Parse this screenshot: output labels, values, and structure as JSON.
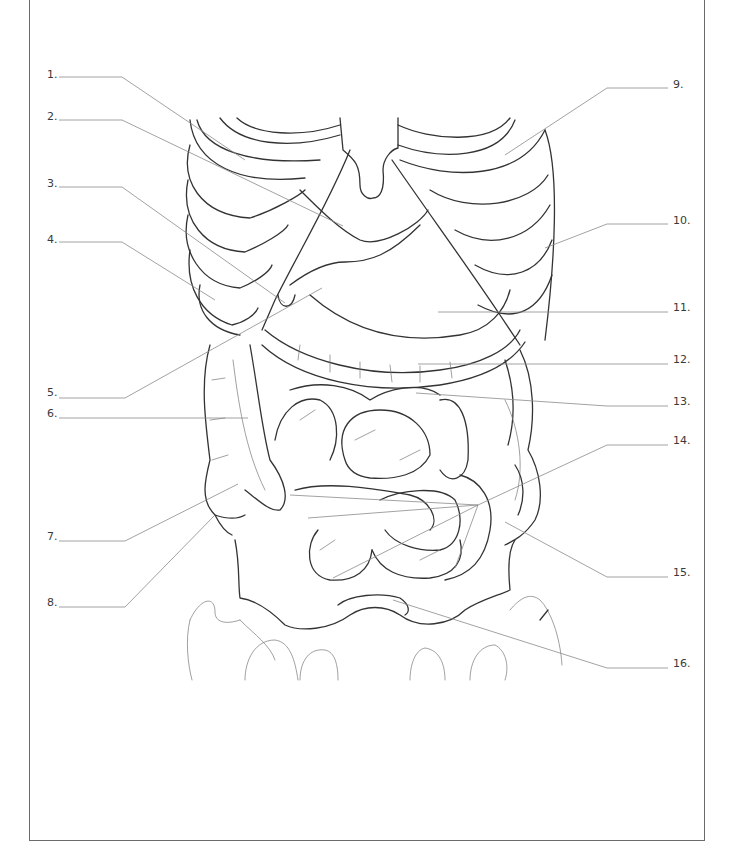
{
  "diagram": {
    "title": "",
    "border_color": "#6b6b6b",
    "line_color": "#333333",
    "leader_color": "#8a8a8a"
  },
  "labels": [
    {
      "id": 1,
      "text": "1.",
      "side": "left",
      "x": 47,
      "y": 69,
      "line": [
        [
          59,
          77
        ],
        [
          122,
          77
        ],
        [
          245,
          160
        ]
      ]
    },
    {
      "id": 2,
      "text": "2.",
      "side": "left",
      "x": 47,
      "y": 111,
      "line": [
        [
          59,
          120
        ],
        [
          122,
          120
        ],
        [
          343,
          226
        ]
      ]
    },
    {
      "id": 3,
      "text": "3.",
      "side": "left",
      "x": 47,
      "y": 178,
      "line": [
        [
          59,
          187
        ],
        [
          122,
          187
        ],
        [
          285,
          303
        ]
      ]
    },
    {
      "id": 4,
      "text": "4.",
      "side": "left",
      "x": 47,
      "y": 234,
      "line": [
        [
          59,
          242
        ],
        [
          122,
          242
        ],
        [
          215,
          300
        ]
      ]
    },
    {
      "id": 5,
      "text": "5.",
      "side": "left",
      "x": 47,
      "y": 387,
      "line": [
        [
          59,
          398
        ],
        [
          125,
          398
        ],
        [
          322,
          288
        ]
      ]
    },
    {
      "id": 6,
      "text": "6.",
      "side": "left",
      "x": 47,
      "y": 408,
      "line": [
        [
          59,
          418
        ],
        [
          248,
          418
        ]
      ]
    },
    {
      "id": 7,
      "text": "7.",
      "side": "left",
      "x": 47,
      "y": 531,
      "line": [
        [
          59,
          541
        ],
        [
          125,
          541
        ],
        [
          238,
          484
        ]
      ]
    },
    {
      "id": 8,
      "text": "8.",
      "side": "left",
      "x": 47,
      "y": 597,
      "line": [
        [
          59,
          607
        ],
        [
          125,
          607
        ],
        [
          215,
          515
        ]
      ]
    },
    {
      "id": 9,
      "text": "9.",
      "side": "right",
      "x": 673,
      "y": 79,
      "line": [
        [
          668,
          88
        ],
        [
          607,
          88
        ],
        [
          505,
          155
        ]
      ]
    },
    {
      "id": 10,
      "text": "10.",
      "side": "right",
      "x": 673,
      "y": 215,
      "line": [
        [
          668,
          224
        ],
        [
          607,
          224
        ],
        [
          545,
          248
        ]
      ]
    },
    {
      "id": 11,
      "text": "11.",
      "side": "right",
      "x": 673,
      "y": 302,
      "line": [
        [
          668,
          312
        ],
        [
          438,
          312
        ]
      ]
    },
    {
      "id": 12,
      "text": "12.",
      "side": "right",
      "x": 673,
      "y": 354,
      "line": [
        [
          668,
          364
        ],
        [
          418,
          364
        ]
      ]
    },
    {
      "id": 13,
      "text": "13.",
      "side": "right",
      "x": 673,
      "y": 396,
      "line": [
        [
          668,
          406
        ],
        [
          607,
          406
        ],
        [
          416,
          393
        ]
      ]
    },
    {
      "id": 14,
      "text": "14.",
      "side": "right",
      "x": 673,
      "y": 435,
      "line": [
        [
          668,
          445
        ],
        [
          607,
          445
        ],
        [
          478,
          505
        ]
      ]
    },
    {
      "id": 15,
      "text": "15.",
      "side": "right",
      "x": 673,
      "y": 567,
      "line": [
        [
          668,
          577
        ],
        [
          607,
          577
        ],
        [
          505,
          522
        ]
      ]
    },
    {
      "id": 16,
      "text": "16.",
      "side": "right",
      "x": 673,
      "y": 658,
      "line": [
        [
          668,
          668
        ],
        [
          607,
          668
        ],
        [
          393,
          600
        ]
      ]
    }
  ],
  "pointer_fans": [
    {
      "label": 14,
      "from": [
        478,
        505
      ],
      "to": [
        [
          290,
          495
        ],
        [
          308,
          518
        ],
        [
          333,
          578
        ],
        [
          455,
          568
        ]
      ]
    }
  ]
}
